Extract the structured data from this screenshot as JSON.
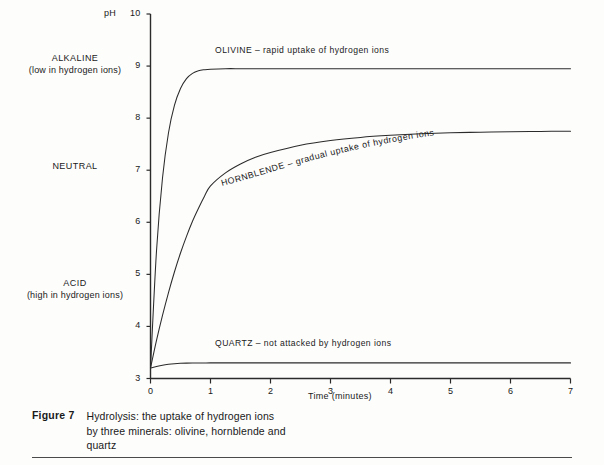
{
  "figure": {
    "number_label": "Figure 7",
    "caption_lines": [
      "Hydrolysis: the uptake of hydrogen ions",
      "by three minerals: olivine, hornblende and",
      "quartz"
    ]
  },
  "axes": {
    "y_title": "pH",
    "x_title": "Time (minutes)",
    "y_ticks": [
      "3",
      "4",
      "5",
      "6",
      "7",
      "8",
      "9",
      "10"
    ],
    "x_ticks": [
      "0",
      "1",
      "2",
      "3",
      "4",
      "5",
      "6",
      "7"
    ]
  },
  "regions": [
    {
      "name": "alkaline",
      "title": "ALKALINE",
      "sub": "(low in hydrogen ions)"
    },
    {
      "name": "neutral",
      "title": "NEUTRAL",
      "sub": ""
    },
    {
      "name": "acid",
      "title": "ACID",
      "sub": "(high in hydrogen ions)"
    }
  ],
  "curve_labels": {
    "olivine": "OLIVINE – rapid uptake of hydrogen ions",
    "hornblende": "HORNBLENDE – gradual uptake of hydrogen ions",
    "quartz": "QUARTZ – not attacked by hydrogen ions"
  },
  "colors": {
    "ink": "#1a1a1a",
    "axis": "#2b2b2b",
    "curve": "#2b2b2b",
    "paper": "#fdfdfc"
  },
  "chart_data": {
    "type": "line",
    "title": "Hydrolysis: the uptake of hydrogen ions by three minerals: olivine, hornblende and quartz",
    "subtitle": "",
    "xlabel": "Time (minutes)",
    "ylabel": "pH",
    "xlim": [
      0,
      7
    ],
    "ylim": [
      3,
      10
    ],
    "xticks": [
      0,
      1,
      2,
      3,
      4,
      5,
      6,
      7
    ],
    "yticks": [
      3,
      4,
      5,
      6,
      7,
      8,
      9,
      10
    ],
    "grid": false,
    "legend": "inline-curve-labels",
    "annotations": [
      {
        "text": "ALKALINE (low in hydrogen ions)",
        "axis": "y",
        "near_value": 9
      },
      {
        "text": "NEUTRAL",
        "axis": "y",
        "near_value": 7
      },
      {
        "text": "ACID (high in hydrogen ions)",
        "axis": "y",
        "near_value": 4.6
      },
      {
        "text": "OLIVINE – rapid uptake of hydrogen ions",
        "series": "olivine"
      },
      {
        "text": "HORNBLENDE – gradual uptake of hydrogen ions",
        "series": "hornblende"
      },
      {
        "text": "QUARTZ – not attacked by hydrogen ions",
        "series": "quartz"
      }
    ],
    "x": [
      0,
      0.1,
      0.2,
      0.3,
      0.4,
      0.5,
      0.6,
      0.7,
      0.8,
      0.9,
      1.0,
      1.25,
      1.5,
      1.75,
      2.0,
      2.5,
      3.0,
      3.5,
      4.0,
      4.5,
      5.0,
      5.5,
      6.0,
      6.5,
      7.0
    ],
    "series": [
      {
        "name": "olivine",
        "plateau": 8.95,
        "start": 3.2,
        "values": [
          3.2,
          5.45,
          6.85,
          7.72,
          8.25,
          8.57,
          8.76,
          8.86,
          8.91,
          8.93,
          8.94,
          8.95,
          8.95,
          8.95,
          8.95,
          8.95,
          8.95,
          8.95,
          8.95,
          8.95,
          8.95,
          8.95,
          8.95,
          8.95,
          8.95
        ]
      },
      {
        "name": "hornblende",
        "plateau": 7.75,
        "start": 3.2,
        "values": [
          3.2,
          3.73,
          4.21,
          4.65,
          5.05,
          5.41,
          5.73,
          6.02,
          6.27,
          6.5,
          6.7,
          6.95,
          7.12,
          7.25,
          7.34,
          7.48,
          7.57,
          7.63,
          7.67,
          7.7,
          7.72,
          7.73,
          7.74,
          7.745,
          7.75
        ]
      },
      {
        "name": "quartz",
        "plateau": 3.3,
        "start": 3.2,
        "values": [
          3.2,
          3.23,
          3.255,
          3.272,
          3.284,
          3.291,
          3.295,
          3.297,
          3.298,
          3.299,
          3.3,
          3.3,
          3.3,
          3.3,
          3.3,
          3.3,
          3.3,
          3.3,
          3.3,
          3.3,
          3.3,
          3.3,
          3.3,
          3.3,
          3.3
        ]
      }
    ]
  }
}
